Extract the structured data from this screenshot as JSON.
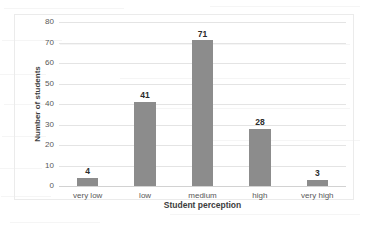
{
  "chart_data": {
    "type": "bar",
    "title": "",
    "subtitle": "",
    "categories": [
      "very low",
      "low",
      "medium",
      "high",
      "very high"
    ],
    "values": [
      4,
      41,
      71,
      28,
      3
    ],
    "data_labels": [
      "4",
      "41",
      "71",
      "28",
      "3"
    ],
    "xlabel": "Student perception",
    "ylabel": "Number of students",
    "ylim": [
      0,
      80
    ],
    "ytick_labels": [
      "80",
      "70",
      "60",
      "50",
      "40",
      "30",
      "20",
      "10",
      "0"
    ],
    "ytick_values": [
      80,
      70,
      60,
      50,
      40,
      30,
      20,
      10,
      0
    ],
    "ytick_step": 10,
    "grid": "horizontal",
    "legend": "none",
    "series": [
      {
        "name": "Number of students",
        "values": [
          4,
          41,
          71,
          28,
          3
        ],
        "color": "#8c8c8c"
      }
    ],
    "colors": {
      "bar": "#8c8c8c",
      "gridline": "#e4e4e4",
      "axis": "#d2d2d2",
      "tick_text": "#585858",
      "title_text": "#3d3d3d",
      "label_text": "#2b2b2b",
      "plot_border": "#ebebeb",
      "background": "#ffffff"
    }
  }
}
